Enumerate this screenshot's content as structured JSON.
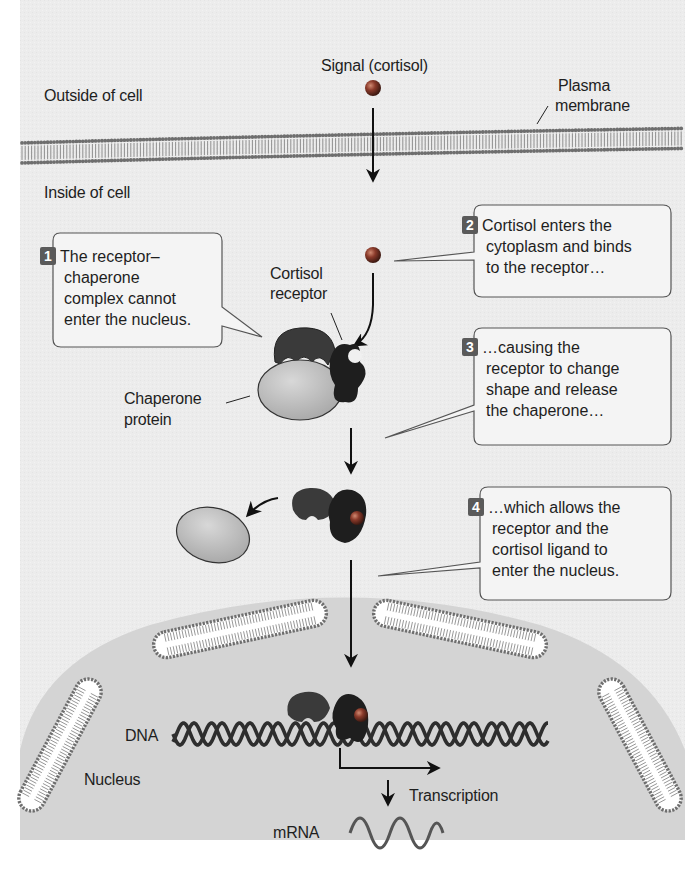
{
  "labels": {
    "signal": "Signal (cortisol)",
    "outside": "Outside of cell",
    "inside": "Inside of cell",
    "plasma_membrane": [
      "Plasma",
      "membrane"
    ],
    "cortisol_receptor": [
      "Cortisol",
      "receptor"
    ],
    "chaperone_protein": [
      "Chaperone",
      "protein"
    ],
    "dna": "DNA",
    "nucleus": "Nucleus",
    "transcription": "Transcription",
    "mrna": "mRNA"
  },
  "callouts": [
    {
      "number": "1",
      "lines": [
        "The receptor–",
        "chaperone",
        "complex cannot",
        "enter the nucleus."
      ]
    },
    {
      "number": "2",
      "lines": [
        "Cortisol enters the",
        "cytoplasm and binds",
        "to the receptor…"
      ]
    },
    {
      "number": "3",
      "lines": [
        "…causing the",
        "receptor to change",
        "shape and release",
        "the chaperone…"
      ]
    },
    {
      "number": "4",
      "lines": [
        "…which allows the",
        "receptor and the",
        "cortisol ligand to",
        "enter the nucleus."
      ]
    }
  ],
  "colors": {
    "background": "#ededed",
    "nucleus_fill": "#d6d6d6",
    "membrane_head": "#6e6e6e",
    "receptor_dark": "#262626",
    "receptor_mid": "#4a4a4a",
    "chaperone": "#c2c2c2",
    "cortisol": "#8a3a2a",
    "dna": "#2e2e2e"
  }
}
